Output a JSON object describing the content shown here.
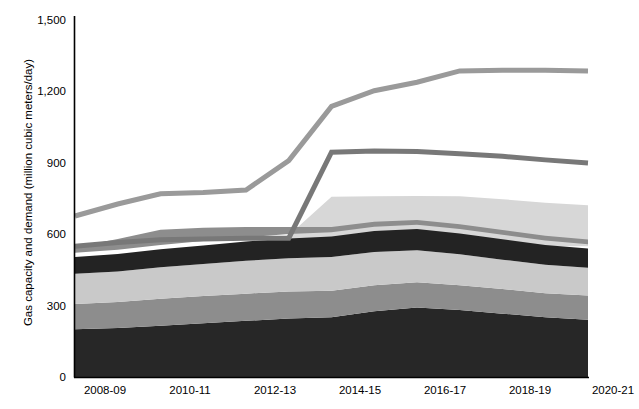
{
  "chart_data": {
    "type": "area",
    "title": "",
    "subtitle": "",
    "xlabel": "",
    "ylabel": "Gas capacity and demand (million cubic meters/day)",
    "ylim": [
      0,
      1500
    ],
    "yticks": [
      0,
      300,
      600,
      900,
      1200,
      1500
    ],
    "ytick_labels": [
      "0",
      "300",
      "600",
      "900",
      "1,200",
      "1,500"
    ],
    "grid": false,
    "legend_position": "none",
    "x": [
      "2008-09",
      "2009-10",
      "2010-11",
      "2011-12",
      "2012-13",
      "2013-14",
      "2014-15",
      "2015-16",
      "2016-17",
      "2017-18",
      "2018-19",
      "2019-20",
      "2020-21"
    ],
    "xtick_labels": [
      "2008-09",
      "2010-11",
      "2012-13",
      "2014-15",
      "2016-17",
      "2018-19",
      "2020-21"
    ],
    "xtick_indices": [
      0,
      2,
      4,
      6,
      8,
      10,
      12
    ],
    "stack_order_bottom_to_top": [
      "domestic-production-band-1",
      "domestic-production-band-2",
      "domestic-production-band-3",
      "domestic-production-band-4",
      "import-capacity-band-5"
    ],
    "series": [
      {
        "name": "domestic-production-band-1",
        "kind": "area",
        "color": "#272727",
        "values": [
          200,
          205,
          215,
          225,
          235,
          245,
          250,
          275,
          290,
          280,
          265,
          250,
          240
        ]
      },
      {
        "name": "domestic-production-band-2",
        "kind": "area",
        "color": "#8d8d8d",
        "values": [
          105,
          108,
          112,
          113,
          113,
          112,
          110,
          108,
          105,
          103,
          102,
          100,
          100
        ]
      },
      {
        "name": "domestic-production-band-3",
        "kind": "area",
        "color": "#c9c9c9",
        "values": [
          125,
          127,
          130,
          133,
          136,
          138,
          140,
          138,
          133,
          128,
          122,
          118,
          115
        ]
      },
      {
        "name": "domestic-production-band-4",
        "kind": "area",
        "color": "#232323",
        "values": [
          70,
          72,
          75,
          77,
          80,
          82,
          85,
          87,
          88,
          87,
          85,
          82,
          80
        ]
      },
      {
        "name": "import-capacity-band-5",
        "kind": "area",
        "color": "#8d8d8d",
        "values": [
          22,
          45,
          63,
          55,
          42,
          30,
          22,
          20,
          20,
          20,
          20,
          20,
          20
        ],
        "gap_below": 18
      },
      {
        "name": "lng-regas-capacity-band",
        "kind": "area-top",
        "color": "#d7d7d7",
        "baseline": 545,
        "values": [
          545,
          545,
          545,
          545,
          545,
          590,
          750,
          752,
          753,
          752,
          740,
          725,
          715
        ]
      },
      {
        "name": "total-capacity-line",
        "kind": "line",
        "color": "#9a9a9a",
        "width": 5,
        "values": [
          670,
          720,
          762,
          768,
          778,
          900,
          1125,
          1190,
          1225,
          1272,
          1275,
          1275,
          1272
        ]
      },
      {
        "name": "gas-demand-line",
        "kind": "line",
        "color": "#787878",
        "width": 5,
        "values": [
          545,
          560,
          572,
          575,
          578,
          578,
          935,
          940,
          938,
          928,
          918,
          903,
          890
        ]
      }
    ]
  }
}
